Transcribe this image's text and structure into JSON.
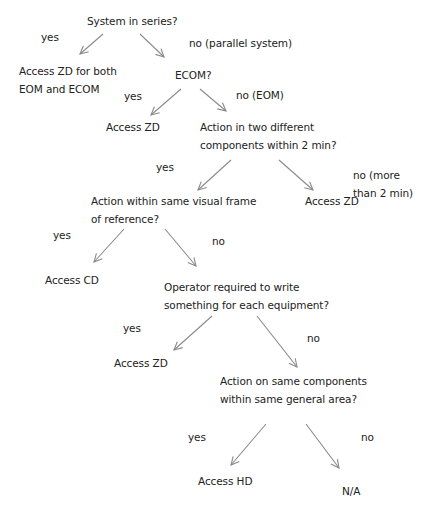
{
  "diagram": {
    "type": "decision-tree",
    "colors": {
      "text": "#222222",
      "arrow": "#8a8a8a",
      "background": "#ffffff"
    },
    "nodes": {
      "q_series": {
        "lines": [
          "System in series?"
        ]
      },
      "r_zd_both": {
        "lines": [
          "Access ZD for both",
          "EOM and ECOM"
        ]
      },
      "q_ecom": {
        "lines": [
          "ECOM?"
        ]
      },
      "r_zd_ecom": {
        "lines": [
          "Access ZD"
        ]
      },
      "q_two_components": {
        "lines": [
          "Action in two different",
          "components within 2 min?"
        ]
      },
      "q_visual_frame": {
        "lines": [
          "Action within same visual frame",
          "of reference?"
        ]
      },
      "r_zd_time": {
        "lines": [
          "Access ZD"
        ]
      },
      "r_cd": {
        "lines": [
          "Access CD"
        ]
      },
      "q_write": {
        "lines": [
          "Operator required to write",
          "something for each equipment?"
        ]
      },
      "r_zd_write": {
        "lines": [
          "Access ZD"
        ]
      },
      "q_same_area": {
        "lines": [
          "Action on same components",
          "within same general area?"
        ]
      },
      "r_hd": {
        "lines": [
          "Access HD"
        ]
      },
      "r_na": {
        "lines": [
          "N/A"
        ]
      }
    },
    "edges": [
      {
        "from": "q_series",
        "to": "r_zd_both",
        "label": "yes",
        "line": [
          103,
          34,
          80,
          54
        ]
      },
      {
        "from": "q_series",
        "to": "q_ecom",
        "label": "no (parallel system)",
        "line": [
          140,
          34,
          164,
          57
        ]
      },
      {
        "from": "q_ecom",
        "to": "r_zd_ecom",
        "label": "yes",
        "line": [
          181,
          89,
          151,
          115
        ]
      },
      {
        "from": "q_ecom",
        "to": "q_two_components",
        "label": "no (EOM)",
        "line": [
          200,
          89,
          226,
          111
        ]
      },
      {
        "from": "q_two_components",
        "to": "q_visual_frame",
        "label": "yes",
        "line": [
          231,
          160,
          198,
          190
        ]
      },
      {
        "from": "q_two_components",
        "to": "r_zd_time",
        "label_lines": [
          "no (more",
          "than 2 min)"
        ],
        "line": [
          279,
          160,
          313,
          190
        ]
      },
      {
        "from": "q_visual_frame",
        "to": "r_cd",
        "label": "yes",
        "line": [
          124,
          229,
          94,
          262
        ]
      },
      {
        "from": "q_visual_frame",
        "to": "q_write",
        "label": "no",
        "line": [
          165,
          229,
          196,
          266
        ]
      },
      {
        "from": "q_write",
        "to": "r_zd_write",
        "label": "yes",
        "line": [
          212,
          316,
          174,
          350
        ]
      },
      {
        "from": "q_write",
        "to": "q_same_area",
        "label": "no",
        "line": [
          257,
          316,
          297,
          367
        ]
      },
      {
        "from": "q_same_area",
        "to": "r_hd",
        "label": "yes",
        "line": [
          266,
          424,
          231,
          465
        ]
      },
      {
        "from": "q_same_area",
        "to": "r_na",
        "label": "no",
        "line": [
          306,
          424,
          339,
          468
        ]
      }
    ]
  }
}
